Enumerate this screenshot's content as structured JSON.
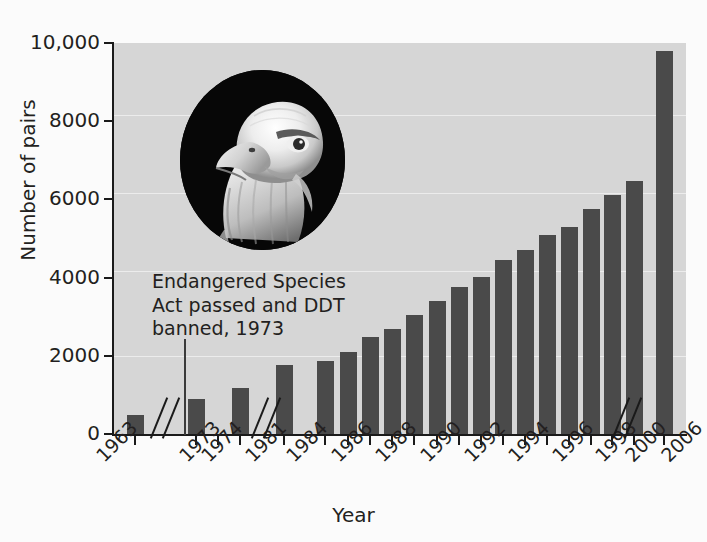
{
  "chart_data": {
    "type": "bar",
    "title": "",
    "xlabel": "Year",
    "ylabel": "Number of pairs",
    "ylim": [
      0,
      10000
    ],
    "yticks": [
      "0",
      "2000",
      "4000",
      "6000",
      "8000",
      "10,000"
    ],
    "ytick_values": [
      0,
      2000,
      4000,
      6000,
      8000,
      10000
    ],
    "grid": "horizontal",
    "legend": "none",
    "bar_color": "#4a4a4a",
    "plot_background": "#d6d6d6",
    "page_background": "#fbfbfb",
    "categories": [
      "1963",
      "1973",
      "1974",
      "1981",
      "1984",
      "1986",
      "1988",
      "1990",
      "1992",
      "1994",
      "1996",
      "1998",
      "2000",
      "2006"
    ],
    "xtick_labels": [
      "1963",
      "1973",
      "1974",
      "1981",
      "1984",
      "1986",
      "1988",
      "1990",
      "1992",
      "1994",
      "1996",
      "1998",
      "2000",
      "2006"
    ],
    "axis_breaks": [
      "between 1963 and 1973",
      "between 1974 and 1981",
      "between 2000 and 2006"
    ],
    "bars": [
      {
        "label": "1963",
        "value": 487
      },
      {
        "label": "1974",
        "value": 900
      },
      {
        "label": "1981",
        "value": 1188
      },
      {
        "label": "1984",
        "value": 1757
      },
      {
        "label": "1986",
        "value": 1875
      },
      {
        "label": "1987",
        "value": 2100
      },
      {
        "label": "1988",
        "value": 2475
      },
      {
        "label": "1989",
        "value": 2680
      },
      {
        "label": "1990",
        "value": 3035
      },
      {
        "label": "1991",
        "value": 3399
      },
      {
        "label": "1992",
        "value": 3749
      },
      {
        "label": "1993",
        "value": 4015
      },
      {
        "label": "1994",
        "value": 4449
      },
      {
        "label": "1995",
        "value": 4712
      },
      {
        "label": "1996",
        "value": 5094
      },
      {
        "label": "1997",
        "value": 5295
      },
      {
        "label": "1998",
        "value": 5748
      },
      {
        "label": "1999",
        "value": 6104
      },
      {
        "label": "2000",
        "value": 6471
      },
      {
        "label": "2006",
        "value": 9789
      }
    ],
    "annotation": {
      "line1": "Endangered Species",
      "line2": "Act passed and DDT",
      "line3": "banned, 1973",
      "points_to": "1973"
    },
    "image": {
      "name": "bald-eagle-photo",
      "description": "Circular black-and-white photograph of a bald eagle head"
    }
  }
}
